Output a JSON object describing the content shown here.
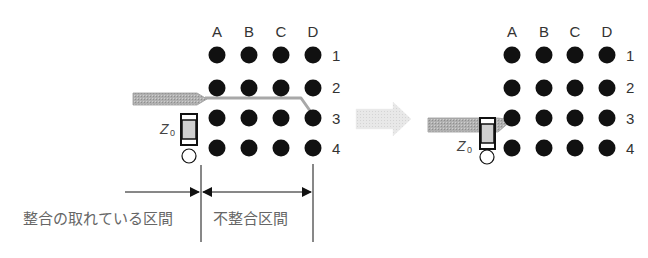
{
  "diagram": {
    "type": "bga-escape-routing-impedance",
    "columns": [
      "A",
      "B",
      "C",
      "D"
    ],
    "rows": [
      "1",
      "2",
      "3",
      "4"
    ],
    "left_panel": {
      "columns_display": [
        "A",
        "B",
        "C",
        "D"
      ],
      "rows_display": [
        "1",
        "2",
        "3",
        "4"
      ],
      "component_label": "Z",
      "component_subscript": "0",
      "trace_target": "D3",
      "matched_section_label": "整合の取れている区間",
      "unmatched_section_label": "不整合区間"
    },
    "transition_arrow": "right-arrow",
    "right_panel": {
      "columns_display": [
        "A",
        "B",
        "C",
        "D"
      ],
      "rows_display": [
        "1",
        "2",
        "3",
        "4"
      ],
      "component_label": "Z",
      "component_subscript": "0",
      "trace_target": "A3"
    },
    "colors": {
      "pad": "#111111",
      "trace": "#a8a8a8",
      "trace_edge": "#999999",
      "component_body": "#cfcfcf",
      "arrow": "#e0e0e0",
      "text": "#333333",
      "jp_text": "#666666"
    }
  }
}
